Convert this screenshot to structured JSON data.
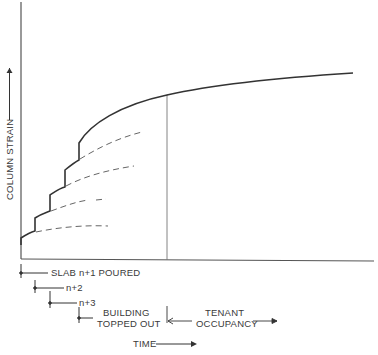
{
  "diagram": {
    "type": "line-schematic",
    "y_axis_label": "COLUMN STRAIN",
    "x_axis_label": "TIME",
    "annotations": {
      "slab_n1": "SLAB n+1 POURED",
      "slab_n2": "n+2",
      "slab_n3": "n+3",
      "topped_line1": "BUILDING",
      "topped_line2": "TOPPED OUT",
      "tenant_line1": "TENANT",
      "tenant_line2": "OCCUPANCY"
    },
    "colors": {
      "curve": "#333333",
      "dashed": "#666666",
      "axis": "#555555",
      "text": "#3a3a3a"
    }
  }
}
